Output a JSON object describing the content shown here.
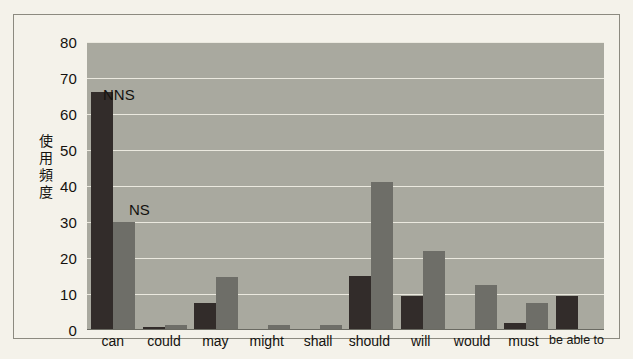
{
  "chart_data": {
    "type": "bar",
    "title": "",
    "subtitle": "",
    "xlabel": "",
    "ylabel": "使用頻度",
    "ylim": [
      0,
      80
    ],
    "yticks": [
      80,
      70,
      60,
      50,
      40,
      30,
      20,
      10,
      0
    ],
    "grid": true,
    "legend_position": "in-plot-annotation",
    "categories": [
      "can",
      "could",
      "may",
      "might",
      "shall",
      "should",
      "will",
      "would",
      "must",
      "be able to"
    ],
    "series": [
      {
        "name": "NNS",
        "color": "#322c2a",
        "values": [
          66,
          0.8,
          7.5,
          0,
          0,
          15,
          9.5,
          0,
          2,
          9.5
        ]
      },
      {
        "name": "NS",
        "color": "#6e6e68",
        "values": [
          30,
          1.5,
          14.8,
          1.5,
          1.5,
          41,
          22,
          12.5,
          7.5,
          0
        ]
      }
    ],
    "annotations": [
      {
        "text": "NNS",
        "target": "can-nns-bar"
      },
      {
        "text": "NS",
        "target": "can-ns-bar"
      }
    ]
  },
  "figure": {
    "background_color": "#f4f2ea",
    "plot_background_color": "#a9a99f",
    "gridline_color": "#ebe9df",
    "border_color": "#8c8a80"
  }
}
